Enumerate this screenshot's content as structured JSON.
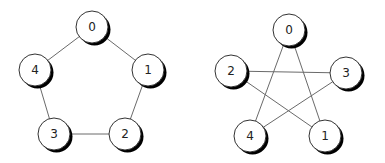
{
  "graphs": [
    {
      "name": "pentagon-graph",
      "nodes": [
        {
          "id": "0",
          "x": 92,
          "y": 27
        },
        {
          "id": "1",
          "x": 148,
          "y": 70
        },
        {
          "id": "2",
          "x": 125,
          "y": 134
        },
        {
          "id": "3",
          "x": 54,
          "y": 134
        },
        {
          "id": "4",
          "x": 35,
          "y": 70
        }
      ],
      "edges": [
        [
          "0",
          "1"
        ],
        [
          "1",
          "2"
        ],
        [
          "2",
          "3"
        ],
        [
          "3",
          "4"
        ],
        [
          "4",
          "0"
        ]
      ]
    },
    {
      "name": "pentagram-graph",
      "nodes": [
        {
          "id": "0",
          "x": 289,
          "y": 30
        },
        {
          "id": "3",
          "x": 346,
          "y": 73
        },
        {
          "id": "1",
          "x": 325,
          "y": 136
        },
        {
          "id": "4",
          "x": 250,
          "y": 136
        },
        {
          "id": "2",
          "x": 231,
          "y": 71
        }
      ],
      "edges": [
        [
          "0",
          "1"
        ],
        [
          "0",
          "4"
        ],
        [
          "2",
          "3"
        ],
        [
          "2",
          "1"
        ],
        [
          "3",
          "4"
        ]
      ]
    }
  ],
  "style": {
    "node_radius": 16,
    "edge_color": "#6a6a6a",
    "node_fill": "#ffffff",
    "shadow_color": "#000000"
  }
}
